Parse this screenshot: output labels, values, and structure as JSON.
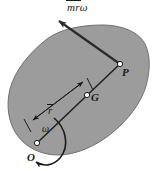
{
  "figure": {
    "background_color": "#ffffff",
    "body_fill_color": "#9c9c9c",
    "body_stroke_color": "#6e6e6e",
    "line_color": "#1a1a1a",
    "labels": {
      "force_vector": {
        "m": "m",
        "r": "r",
        "omega": "ω"
      },
      "point_p": "P",
      "point_g": "G",
      "radius": "r",
      "angular_velocity": "ω",
      "point_o": "O"
    },
    "elements": [
      {
        "name": "rigid-body-blob",
        "type": "shape"
      },
      {
        "name": "line-o-to-p",
        "type": "line"
      },
      {
        "name": "dimension-line-rbar",
        "type": "dimension"
      },
      {
        "name": "rotation-arc-omega",
        "type": "arc"
      },
      {
        "name": "force-vector-arrow",
        "type": "arrow"
      },
      {
        "name": "point-marker-o",
        "type": "point"
      },
      {
        "name": "point-marker-g",
        "type": "point"
      },
      {
        "name": "point-marker-p",
        "type": "point"
      }
    ]
  }
}
